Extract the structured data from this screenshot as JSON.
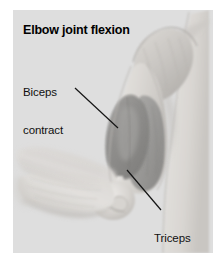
{
  "figure": {
    "title": "Elbow joint flexion",
    "background_color": "#ffffff",
    "panel_color": "#dedede"
  },
  "labels": [
    {
      "id": "biceps",
      "text": "Biceps\ncontract",
      "line1": "Biceps",
      "line2": "contract",
      "leader_from": [
        62,
        78
      ],
      "leader_to": [
        105,
        118
      ]
    },
    {
      "id": "triceps",
      "text": "Triceps\nextend",
      "line1": "Triceps",
      "line2": "extend",
      "leader_from": [
        148,
        200
      ],
      "leader_to": [
        114,
        160
      ]
    }
  ],
  "illustration": {
    "style": "grayscale-medical-drawing",
    "elements": [
      "shoulder-deltoid",
      "humerus",
      "biceps-brachii-contracted",
      "triceps-brachii-extended",
      "elbow-joint",
      "forearm-flexed",
      "torso-edge"
    ],
    "skin_light": "#e8e6e3",
    "skin_mid": "#cfccc8",
    "skin_shadow": "#b4b1ad",
    "muscle_dark": "#8e8d8b",
    "muscle_mid": "#a3a2a0",
    "line_color": "#1a1a1a"
  }
}
